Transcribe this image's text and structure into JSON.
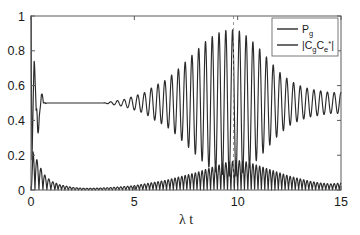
{
  "chart_data": {
    "type": "line",
    "title": "",
    "xlabel": "λ t",
    "ylabel": "",
    "xlim": [
      0,
      15
    ],
    "ylim": [
      0,
      1
    ],
    "xticks": [
      0,
      5,
      10,
      15
    ],
    "xtick_labels": [
      "0",
      "5",
      "10",
      "15"
    ],
    "yticks": [
      0,
      0.2,
      0.4,
      0.6,
      0.8,
      1
    ],
    "ytick_labels": [
      "0",
      "0.2",
      "0.4",
      "0.6",
      "0.8",
      "1"
    ],
    "grid": false,
    "legend_position": "top-right",
    "annotations": [
      {
        "type": "vline",
        "x": 9.8,
        "style": "dashed",
        "color": "#8a8a8a"
      }
    ],
    "series": [
      {
        "name": "P_g",
        "legend_label": "P",
        "legend_sub": "g",
        "color": "#2b2b2b",
        "description": "Ground state population: starts at 1, collapses with damped high-frequency ringing to a plateau near 0.5, then revives into a large oscillation burst peaking near λt=10 before decaying",
        "x": [
          0,
          0.05,
          0.1,
          0.15,
          0.2,
          0.25,
          0.3,
          0.35,
          0.4,
          0.45,
          0.5,
          0.55,
          0.6,
          0.65,
          0.7,
          0.75,
          0.8,
          0.85,
          0.9,
          0.95,
          1,
          1.1,
          1.2,
          1.3,
          1.4,
          1.5,
          1.6,
          1.7,
          1.8,
          1.9,
          2,
          2.5,
          3,
          3.5,
          4,
          4.5,
          5,
          5.5,
          6,
          6.5,
          7,
          7.5,
          8,
          8.5,
          9,
          9.5,
          10,
          10.5,
          11,
          11.5,
          12,
          12.5,
          13,
          13.5,
          14,
          14.5,
          15
        ],
        "envelope_hi": [
          1,
          1,
          0.86,
          0.83,
          0.62,
          0.55,
          0.82,
          0.7,
          0.55,
          0.52,
          0.58,
          0.55,
          0.5,
          0.5,
          0.52,
          0.5,
          0.5,
          0.5,
          0.5,
          0.5,
          0.5,
          0.5,
          0.5,
          0.5,
          0.5,
          0.5,
          0.5,
          0.5,
          0.5,
          0.5,
          0.5,
          0.5,
          0.5,
          0.5,
          0.51,
          0.52,
          0.54,
          0.56,
          0.6,
          0.63,
          0.68,
          0.74,
          0.8,
          0.86,
          0.9,
          0.92,
          0.92,
          0.88,
          0.82,
          0.75,
          0.68,
          0.63,
          0.6,
          0.58,
          0.57,
          0.56,
          0.56
        ],
        "envelope_lo": [
          1,
          0.02,
          0.02,
          0.03,
          0.05,
          0.1,
          0.15,
          0.3,
          0.42,
          0.46,
          0.48,
          0.49,
          0.5,
          0.5,
          0.49,
          0.5,
          0.5,
          0.5,
          0.5,
          0.5,
          0.5,
          0.5,
          0.5,
          0.5,
          0.5,
          0.5,
          0.5,
          0.5,
          0.5,
          0.5,
          0.5,
          0.5,
          0.5,
          0.5,
          0.49,
          0.48,
          0.46,
          0.44,
          0.4,
          0.37,
          0.32,
          0.26,
          0.2,
          0.14,
          0.1,
          0.08,
          0.08,
          0.12,
          0.18,
          0.25,
          0.32,
          0.37,
          0.4,
          0.42,
          0.43,
          0.44,
          0.44
        ],
        "plateau_value": 0.5,
        "initial_value": 1.0,
        "first_rebound_peak": 0.82,
        "revival_peak": 0.92,
        "revival_min": 0.08,
        "revival_center_x": 9.9
      },
      {
        "name": "|C_g C_e^*|",
        "legend_label": "|C",
        "legend_sub": "g",
        "legend_label2": "C",
        "legend_sub2": "e",
        "legend_sup2": "*",
        "legend_tail": "|",
        "color": "#2b2b2b",
        "description": "Coherence magnitude: sharp decaying spikes from 0.22 near t=0, flat near zero, then a slowly growing oscillation envelope peaking about 0.17 near λt=10 and decaying afterwards",
        "x": [
          0,
          0.1,
          0.2,
          0.3,
          0.4,
          0.5,
          0.6,
          0.7,
          0.8,
          0.9,
          1,
          1.2,
          1.4,
          1.6,
          1.8,
          2,
          2.5,
          3,
          3.5,
          4,
          4.5,
          5,
          5.5,
          6,
          6.5,
          7,
          7.5,
          8,
          8.5,
          9,
          9.5,
          10,
          10.5,
          11,
          11.5,
          12,
          12.5,
          13,
          13.5,
          14,
          14.5,
          15
        ],
        "envelope_hi": [
          0.0,
          0.22,
          0.2,
          0.17,
          0.14,
          0.12,
          0.1,
          0.08,
          0.07,
          0.06,
          0.05,
          0.04,
          0.03,
          0.025,
          0.02,
          0.015,
          0.01,
          0.01,
          0.012,
          0.015,
          0.02,
          0.025,
          0.035,
          0.045,
          0.055,
          0.07,
          0.085,
          0.1,
          0.12,
          0.14,
          0.16,
          0.17,
          0.16,
          0.14,
          0.12,
          0.1,
          0.08,
          0.065,
          0.05,
          0.04,
          0.035,
          0.04
        ],
        "peak_value": 0.17,
        "peak_x": 10.0,
        "initial_spike": 0.22
      }
    ]
  },
  "legend": {
    "entries": [
      {
        "id": "pg",
        "base": "P",
        "sub": "g",
        "sup": "",
        "tail": ""
      },
      {
        "id": "coh",
        "base": "|C",
        "sub": "g",
        "base2": "C",
        "sub2": "e",
        "sup2": "*",
        "tail": "|"
      }
    ]
  },
  "axes": {
    "xlabel": "λ t",
    "xtick_labels": [
      "0",
      "5",
      "10",
      "15"
    ],
    "ytick_labels": [
      "0",
      "0.2",
      "0.4",
      "0.6",
      "0.8",
      "1"
    ]
  }
}
